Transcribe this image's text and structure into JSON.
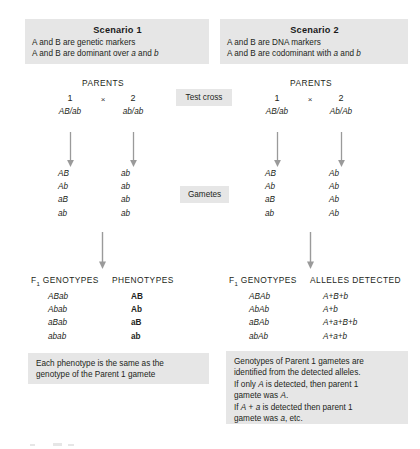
{
  "figure": {
    "background_color": "#ffffff",
    "shade_color": "#e6e6e6",
    "text_color": "#231f20"
  },
  "scenario1": {
    "title": "Scenario 1",
    "line1": "A and B are genetic markers",
    "line2_pre": "A and B are dominant over ",
    "line2_italic1": "a",
    "line2_mid": " and ",
    "line2_italic2": "b",
    "parents_label": "PARENTS",
    "parent1_number": "1",
    "cross_symbol": "×",
    "parent2_number": "2",
    "parent1_genotype": "AB/ab",
    "parent2_genotype": "ab/ab",
    "gametes_parent1": [
      "AB",
      "Ab",
      "aB",
      "ab"
    ],
    "gametes_parent2": [
      "ab",
      "ab",
      "ab",
      "ab"
    ],
    "f1_genotypes_header": "GENOTYPES",
    "f1_header_prefix": "F",
    "f1_header_sub": "1",
    "phenotypes_header": "PHENOTYPES",
    "f1_genotypes": [
      "ABab",
      "Abab",
      "aBab",
      "abab"
    ],
    "phenotypes": [
      "AB",
      "Ab",
      "aB",
      "ab"
    ],
    "note_line1": "Each phenotype is the same as the",
    "note_line2": "genotype of the Parent 1 gamete"
  },
  "scenario2": {
    "title": "Scenario 2",
    "line1": "A and B are DNA markers",
    "line2_pre": "A and B are codominant with ",
    "line2_italic1": "a",
    "line2_mid": " and ",
    "line2_italic2": "b",
    "parents_label": "PARENTS",
    "parent1_number": "1",
    "cross_symbol": "×",
    "parent2_number": "2",
    "parent1_genotype": "AB/ab",
    "parent2_genotype": "Ab/Ab",
    "gametes_parent1": [
      "AB",
      "Ab",
      "aB",
      "ab"
    ],
    "gametes_parent2": [
      "Ab",
      "Ab",
      "Ab",
      "Ab"
    ],
    "f1_genotypes_header": "GENOTYPES",
    "f1_header_prefix": "F",
    "f1_header_sub": "1",
    "alleles_header": "ALLELES DETECTED",
    "f1_genotypes": [
      "ABAb",
      "AbAb",
      "aBAb",
      "abAb"
    ],
    "alleles_detected": [
      "A+B+b",
      "A+b",
      "A+a+B+b",
      "A+a+b"
    ],
    "note_line1": "Genotypes of Parent 1 gametes are",
    "note_line2": "identified from the detected alleles.",
    "note_line3_pre": "If only ",
    "note_line3_italic": "A",
    "note_line3_post": " is detected, then parent 1",
    "note_line4_pre": "gamete was ",
    "note_line4_italic": "A",
    "note_line4_post": ".",
    "note_line5_pre": "If ",
    "note_line5_italic1": "A",
    "note_line5_mid": " + ",
    "note_line5_italic2": "a",
    "note_line5_post": " is detected then parent 1",
    "note_line6_pre": "gamete was ",
    "note_line6_italic": "a",
    "note_line6_post": ", etc."
  },
  "center_labels": {
    "test_cross": "Test cross",
    "gametes": "Gametes"
  }
}
